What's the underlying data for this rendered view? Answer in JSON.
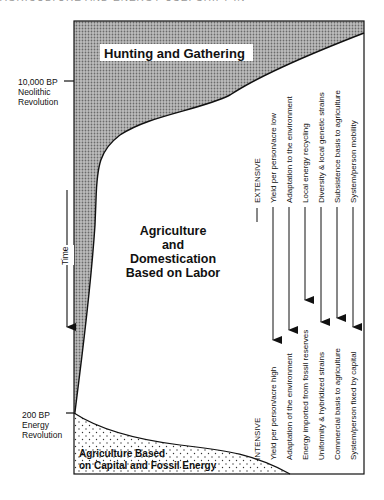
{
  "header_fragment": "AGRICULTURE AND ENERGY USE: SHIFT IN THE HUMAN SUBSISTENCE BASE",
  "labels": {
    "hunting": "Hunting and Gathering",
    "neolithic": [
      "10,000 BP",
      "Neolithic",
      "Revolution"
    ],
    "energy": [
      "200 BP",
      "Energy",
      "Revolution"
    ],
    "time": "Time",
    "labor": [
      "Agriculture",
      "and",
      "Domestication",
      "Based on Labor"
    ],
    "capital": [
      "Agriculture Based",
      "on Capital and Fossil Energy"
    ]
  },
  "extensive": {
    "heading": "EXTENSIVE",
    "items": [
      "Yield per person/acre low",
      "Adaptation to the environment",
      "Local energy recycling",
      "Diversity & local genetic strains",
      "Subsistence basis to agriculture",
      "System/person mobility"
    ]
  },
  "intensive": {
    "heading": "INTENSIVE",
    "items": [
      "Yield per person/acre high",
      "Adaptation of the environment",
      "Energy imported from fossil reserves",
      "Uniformity & hybridized strains",
      "Commercial basis to agriculture",
      "System/person fixed by capital"
    ]
  }
}
